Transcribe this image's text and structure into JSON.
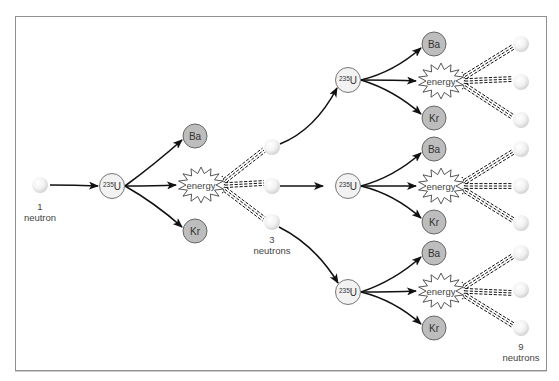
{
  "diagram": {
    "colors": {
      "frame": "#8f8f8f",
      "arrow": "#111111",
      "u235_fill": "#f2f2f2",
      "u235_stroke": "#777777",
      "product_fill": "#bdbdbd",
      "product_stroke": "#666666",
      "energy_fill": "#ffffff",
      "energy_stroke": "#444444",
      "neutron_light": "#ffffff",
      "neutron_dark": "#d6d6d6"
    },
    "labels": {
      "initial_count": "1",
      "initial_unit": "neutron",
      "gen2_count": "3",
      "gen2_unit": "neutrons",
      "gen3_count": "9",
      "gen3_unit": "neutrons",
      "u235_mass": "235",
      "u235_symbol": "U",
      "product_a": "Ba",
      "product_b": "Kr",
      "energy": "energy"
    },
    "stages": [
      {
        "name": "generation-1",
        "u235": {
          "x": 112,
          "y": 186
        },
        "ba": {
          "x": 195,
          "y": 136
        },
        "kr": {
          "x": 195,
          "y": 231
        },
        "energy": {
          "x": 201,
          "y": 185
        },
        "neutrons": [
          {
            "x": 272,
            "y": 147
          },
          {
            "x": 272,
            "y": 186
          },
          {
            "x": 272,
            "y": 222
          }
        ]
      },
      {
        "name": "generation-2-top",
        "u235": {
          "x": 348,
          "y": 80
        },
        "ba": {
          "x": 434,
          "y": 44
        },
        "kr": {
          "x": 434,
          "y": 118
        },
        "energy": {
          "x": 441,
          "y": 81
        },
        "neutrons": [
          {
            "x": 521,
            "y": 44
          },
          {
            "x": 521,
            "y": 82
          },
          {
            "x": 521,
            "y": 120
          }
        ]
      },
      {
        "name": "generation-2-middle",
        "u235": {
          "x": 348,
          "y": 186
        },
        "ba": {
          "x": 434,
          "y": 149
        },
        "kr": {
          "x": 434,
          "y": 222
        },
        "energy": {
          "x": 441,
          "y": 186
        },
        "neutrons": [
          {
            "x": 521,
            "y": 149
          },
          {
            "x": 521,
            "y": 186
          },
          {
            "x": 521,
            "y": 223
          }
        ]
      },
      {
        "name": "generation-2-bottom",
        "u235": {
          "x": 348,
          "y": 292
        },
        "ba": {
          "x": 434,
          "y": 253
        },
        "kr": {
          "x": 434,
          "y": 328
        },
        "energy": {
          "x": 441,
          "y": 291
        },
        "neutrons": [
          {
            "x": 521,
            "y": 253
          },
          {
            "x": 521,
            "y": 290
          },
          {
            "x": 521,
            "y": 328
          }
        ]
      }
    ],
    "initial_neutron": {
      "x": 40,
      "y": 185
    }
  }
}
